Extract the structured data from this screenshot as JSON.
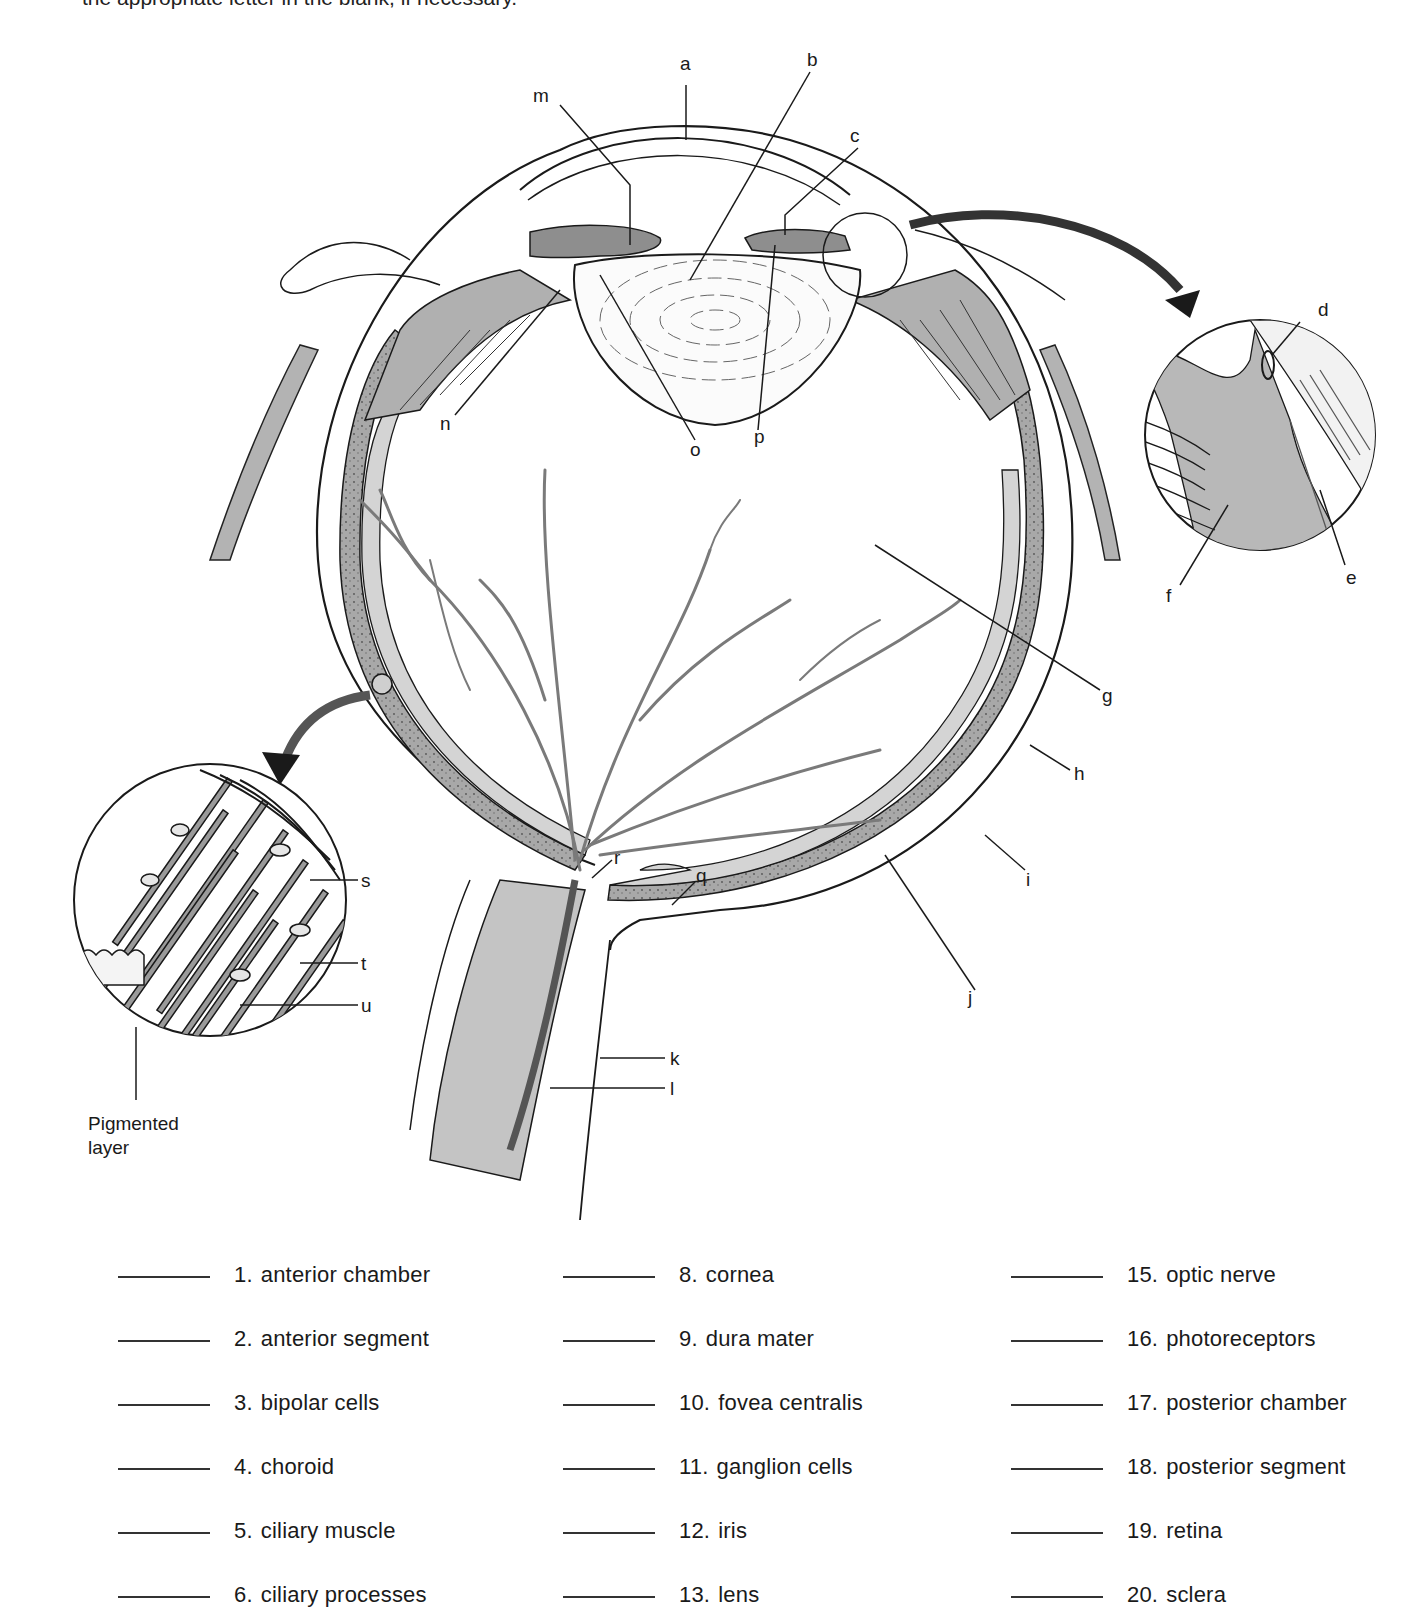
{
  "instructions_fragment": "the appropriate letter in the blank, if necessary.",
  "diagram": {
    "labels": {
      "a": "a",
      "b": "b",
      "c": "c",
      "d": "d",
      "e": "e",
      "f": "f",
      "g": "g",
      "h": "h",
      "i": "i",
      "j": "j",
      "k": "k",
      "l": "l",
      "m": "m",
      "n": "n",
      "o": "o",
      "p": "p",
      "q": "q",
      "r": "r",
      "s": "s",
      "t": "t",
      "u": "u"
    },
    "inset_label_line1": "Pigmented",
    "inset_label_line2": "layer",
    "colors": {
      "tissue_gray": "#b9b9b9",
      "dark_gray": "#8e8e8e",
      "line": "#1a1a1a"
    }
  },
  "matching": {
    "columns": [
      [
        {
          "num": "1.",
          "term": "anterior chamber"
        },
        {
          "num": "2.",
          "term": "anterior segment"
        },
        {
          "num": "3.",
          "term": "bipolar cells"
        },
        {
          "num": "4.",
          "term": "choroid"
        },
        {
          "num": "5.",
          "term": "ciliary muscle"
        },
        {
          "num": "6.",
          "term": "ciliary processes"
        }
      ],
      [
        {
          "num": "8.",
          "term": "cornea"
        },
        {
          "num": "9.",
          "term": "dura mater"
        },
        {
          "num": "10.",
          "term": "fovea centralis"
        },
        {
          "num": "11.",
          "term": "ganglion cells"
        },
        {
          "num": "12.",
          "term": "iris"
        },
        {
          "num": "13.",
          "term": "lens"
        }
      ],
      [
        {
          "num": "15.",
          "term": "optic nerve"
        },
        {
          "num": "16.",
          "term": "photoreceptors"
        },
        {
          "num": "17.",
          "term": "posterior chamber"
        },
        {
          "num": "18.",
          "term": "posterior segment"
        },
        {
          "num": "19.",
          "term": "retina"
        },
        {
          "num": "20.",
          "term": "sclera"
        }
      ]
    ]
  }
}
